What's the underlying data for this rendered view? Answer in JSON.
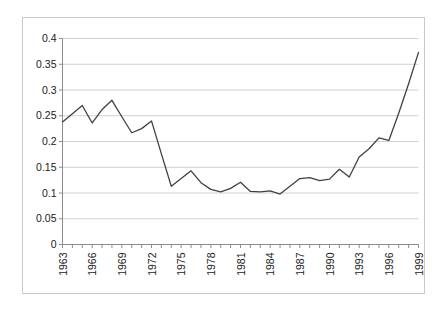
{
  "chart_data": {
    "type": "line",
    "title": "",
    "subtitle": "",
    "xlabel": "",
    "ylabel": "",
    "xlim": [
      1963,
      1999
    ],
    "ylim": [
      0,
      0.4
    ],
    "grid": true,
    "grid_axis": "y",
    "legend": false,
    "legend_position": "none",
    "line_color": "#404040",
    "grid_color": "#d0d0d0",
    "axis_color": "#8c8c8c",
    "background_color": "#ffffff",
    "y_ticks": [
      0,
      0.05,
      0.1,
      0.15,
      0.2,
      0.25,
      0.3,
      0.35,
      0.4
    ],
    "y_tick_labels": [
      "0",
      "0.05",
      "0.1",
      "0.15",
      "0.2",
      "0.25",
      "0.3",
      "0.35",
      "0.4"
    ],
    "x_tick_labels": [
      "1963",
      "1966",
      "1969",
      "1972",
      "1975",
      "1978",
      "1981",
      "1984",
      "1987",
      "1990",
      "1993",
      "1996",
      "1999"
    ],
    "x_tick_label_rotation": -90,
    "x_tick_interval": 3,
    "x": [
      1963,
      1964,
      1965,
      1966,
      1967,
      1968,
      1969,
      1970,
      1971,
      1972,
      1973,
      1974,
      1975,
      1976,
      1977,
      1978,
      1979,
      1980,
      1981,
      1982,
      1983,
      1984,
      1985,
      1986,
      1987,
      1988,
      1989,
      1990,
      1991,
      1992,
      1993,
      1994,
      1995,
      1996,
      1997,
      1998,
      1999
    ],
    "values": [
      0.238,
      0.254,
      0.27,
      0.236,
      0.262,
      0.28,
      0.248,
      0.217,
      0.225,
      0.24,
      0.176,
      0.113,
      0.128,
      0.143,
      0.12,
      0.107,
      0.102,
      0.109,
      0.121,
      0.103,
      0.102,
      0.104,
      0.098,
      0.113,
      0.128,
      0.13,
      0.124,
      0.127,
      0.146,
      0.131,
      0.17,
      0.186,
      0.207,
      0.202,
      0.255,
      0.312,
      0.373
    ],
    "series": [
      {
        "name": "series-1",
        "values": [
          0.238,
          0.254,
          0.27,
          0.236,
          0.262,
          0.28,
          0.248,
          0.217,
          0.225,
          0.24,
          0.176,
          0.113,
          0.128,
          0.143,
          0.12,
          0.107,
          0.102,
          0.109,
          0.121,
          0.103,
          0.102,
          0.104,
          0.098,
          0.113,
          0.128,
          0.13,
          0.124,
          0.127,
          0.146,
          0.131,
          0.17,
          0.186,
          0.207,
          0.202,
          0.255,
          0.312,
          0.373
        ]
      }
    ]
  }
}
